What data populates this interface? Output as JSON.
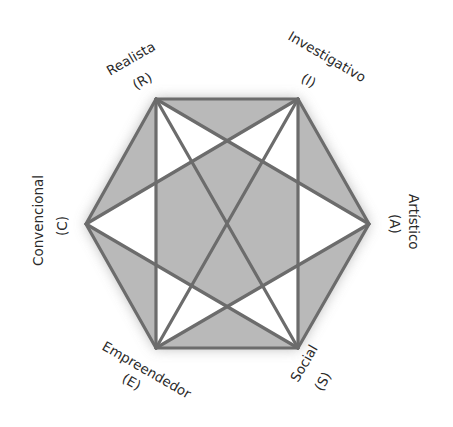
{
  "diagram": {
    "type": "holland-hexagon",
    "colors": {
      "fill_gray": "#b9b9b9",
      "fill_white": "#ffffff",
      "line": "#6c6c6c",
      "glow": "#9a9a9a",
      "text": "#2a2a2a"
    },
    "vertices": {
      "R": {
        "x": 156,
        "y": 99
      },
      "I": {
        "x": 298,
        "y": 99
      },
      "A": {
        "x": 369,
        "y": 224
      },
      "S": {
        "x": 298,
        "y": 348
      },
      "E": {
        "x": 156,
        "y": 348
      },
      "C": {
        "x": 86,
        "y": 224
      }
    },
    "labels": {
      "realista": {
        "name": "Realista",
        "code": "(R)"
      },
      "investigativo": {
        "name": "Investigativo",
        "code": "(I)"
      },
      "artistico": {
        "name": "Artístico",
        "code": "(A)"
      },
      "social": {
        "name": "Social",
        "code": "(S)"
      },
      "empreendedor": {
        "name": "Empreendedor",
        "code": "(E)"
      },
      "convencional": {
        "name": "Convencional",
        "code": "(C)"
      }
    },
    "edges": [
      [
        "R",
        "I"
      ],
      [
        "I",
        "A"
      ],
      [
        "A",
        "S"
      ],
      [
        "S",
        "E"
      ],
      [
        "E",
        "C"
      ],
      [
        "C",
        "R"
      ],
      [
        "R",
        "E"
      ],
      [
        "I",
        "S"
      ],
      [
        "R",
        "A"
      ],
      [
        "A",
        "E"
      ],
      [
        "I",
        "C"
      ],
      [
        "C",
        "S"
      ],
      [
        "R",
        "S"
      ],
      [
        "I",
        "E"
      ]
    ]
  }
}
